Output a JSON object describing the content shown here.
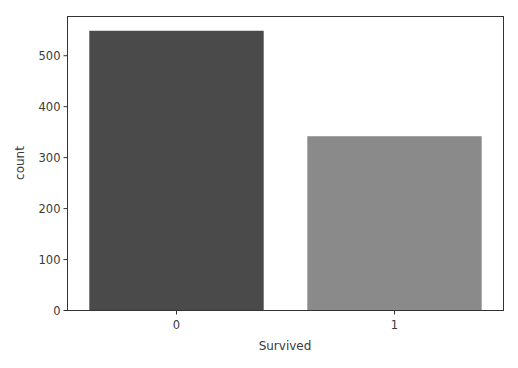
{
  "chart_data": {
    "type": "bar",
    "title": "",
    "xlabel": "Survived",
    "ylabel": "count",
    "categories": [
      "0",
      "1"
    ],
    "values": [
      549,
      342
    ],
    "colors": [
      "#4a4a4a",
      "#8a8a8a"
    ],
    "ylim": [
      0,
      577
    ],
    "yticks": [
      0,
      100,
      200,
      300,
      400,
      500
    ],
    "grid": false,
    "legend": null
  }
}
